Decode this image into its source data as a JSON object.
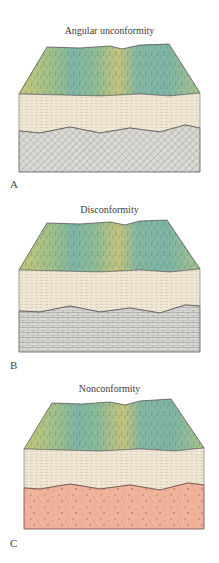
{
  "figure": {
    "panels": [
      {
        "id": "A",
        "letter": "A",
        "title": "Angular unconformity",
        "lower_layer": "tilted crystalline rock (hatched gray)"
      },
      {
        "id": "B",
        "letter": "B",
        "title": "Disconformity",
        "lower_layer": "horizontal bedded limestone (gray)"
      },
      {
        "id": "C",
        "letter": "C",
        "title": "Nonconformity",
        "lower_layer": "igneous/metamorphic rock (speckled pink)"
      }
    ],
    "colors": {
      "surface_green": "#9fc08a",
      "surface_teal": "#7fb4a8",
      "surface_yellow": "#c8c87a",
      "sandstone_tan": "#efe6d4",
      "limestone_gray": "#d8d6d2",
      "granite_pink": "#eeb39a",
      "outline": "#555555"
    }
  }
}
